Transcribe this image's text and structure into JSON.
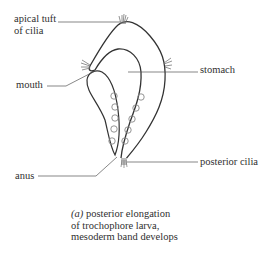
{
  "figure": {
    "labels": {
      "apical_tuft_line1": "apical tuft",
      "apical_tuft_line2": "of cilia",
      "mouth": "mouth",
      "stomach": "stomach",
      "anus": "anus",
      "posterior_cilia": "posterior cilia"
    },
    "caption": {
      "marker": "(a)",
      "line1": "posterior elongation",
      "line2": "of trochophore larva,",
      "line3": "mesoderm band develops"
    },
    "colors": {
      "outline": "#333333",
      "leader_line": "#555555",
      "mesoderm_circle": "#888888",
      "cilia": "#777777"
    }
  }
}
